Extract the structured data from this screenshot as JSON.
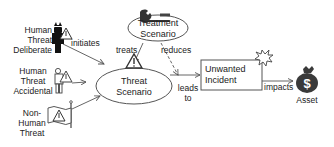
{
  "diagram": {
    "type": "threat-model",
    "nodes": {
      "human_threat_deliberate": {
        "label_line1": "Human",
        "label_line2": "Threat",
        "label_line3": "Deliberate",
        "icon": "devil-person-warning-icon"
      },
      "human_threat_accidental": {
        "label_line1": "Human",
        "label_line2": "Threat",
        "label_line3": "Accidental",
        "icon": "person-warning-icon"
      },
      "non_human_threat": {
        "label_line1": "Non-",
        "label_line2": "Human",
        "label_line3": "Threat",
        "icon": "flag-warning-icon"
      },
      "threat_scenario": {
        "label_line1": "Threat",
        "label_line2": "Scenario",
        "shape": "ellipse",
        "icon": "warning-triangle-icon"
      },
      "treatment_scenario": {
        "label_line1": "Treatment",
        "label_line2": "Scenario",
        "shape": "ellipse",
        "icon": "wrench-icon"
      },
      "unwanted_incident": {
        "label_line1": "Unwanted",
        "label_line2": "Incident",
        "shape": "rectangle",
        "icon": "explosion-icon"
      },
      "asset": {
        "label": "Asset",
        "icon": "money-bag-icon",
        "symbol": "$"
      }
    },
    "edges": [
      {
        "from": "human_threat_deliberate",
        "to": "threat_scenario",
        "label": "initiates",
        "style": "solid"
      },
      {
        "from": "human_threat_accidental",
        "to": "threat_scenario",
        "label": "",
        "style": "solid"
      },
      {
        "from": "non_human_threat",
        "to": "threat_scenario",
        "label": "",
        "style": "solid"
      },
      {
        "from": "treatment_scenario",
        "to": "threat_scenario",
        "label": "treats",
        "style": "solid"
      },
      {
        "from": "treatment_scenario",
        "to": "unwanted_incident",
        "label": "reduces",
        "style": "dashed"
      },
      {
        "from": "threat_scenario",
        "to": "unwanted_incident",
        "label_line1": "leads",
        "label_line2": "to",
        "style": "solid"
      },
      {
        "from": "unwanted_incident",
        "to": "asset",
        "label": "impacts",
        "style": "solid"
      }
    ],
    "colors": {
      "line": "#555555",
      "text": "#222222",
      "asset_fill": "#3a3a3a",
      "explosion_fill": "#ffffff"
    }
  }
}
